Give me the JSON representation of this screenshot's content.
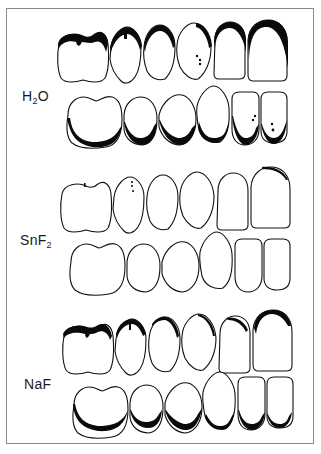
{
  "figure": {
    "type": "dental caries diagram",
    "groups": [
      {
        "id": "h2o",
        "label_main": "H",
        "label_sub": "2",
        "label_tail": "O",
        "severity": "heavy",
        "upper_lesions": "extensive occlusal/incisal shading on all six teeth",
        "lower_lesions": "extensive cervical shading on all six teeth"
      },
      {
        "id": "snf2",
        "label_main": "SnF",
        "label_sub": "2",
        "label_tail": "",
        "severity": "minimal",
        "upper_lesions": "trace marks only",
        "lower_lesions": "none"
      },
      {
        "id": "naf",
        "label_main": "NaF",
        "label_sub": "",
        "label_tail": "",
        "severity": "moderate",
        "upper_lesions": "moderate occlusal shading",
        "lower_lesions": "moderate cervical shading"
      }
    ],
    "colors": {
      "outline": "#111111",
      "lesion": "#0a0a0a",
      "frame": "#8a8a8a",
      "background": "#ffffff"
    }
  }
}
